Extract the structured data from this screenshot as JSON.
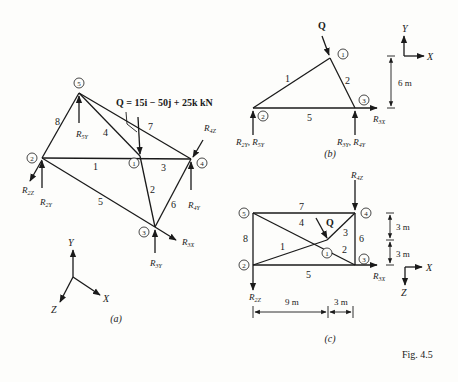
{
  "figure": {
    "caption": "Fig. 4.5",
    "views": [
      {
        "id": "a",
        "label": "(a)"
      },
      {
        "id": "b",
        "label": "(b)"
      },
      {
        "id": "c",
        "label": "(c)"
      }
    ],
    "load": {
      "name": "Q",
      "expression": "Q = 15i − 50j + 25k kN"
    },
    "nodes": [
      "1",
      "2",
      "3",
      "4",
      "5"
    ],
    "members": [
      "1",
      "2",
      "3",
      "4",
      "5",
      "6",
      "7",
      "8"
    ],
    "reactions_a": [
      "R5Y",
      "R2Z",
      "R2Y",
      "R4Z",
      "R4Y",
      "R3X",
      "R3Y"
    ],
    "axes_a": {
      "y": "Y",
      "x": "X",
      "z": "Z"
    },
    "view_b": {
      "reactions": {
        "left": "R2Y, R5Y",
        "right": "R3Y, R4Y",
        "horizontal": "R3X"
      },
      "dimension": "6 m",
      "axes": {
        "y": "Y",
        "x": "X"
      }
    },
    "view_c": {
      "reactions": {
        "top": "R4Z",
        "left": "R2Z",
        "horizontal": "R3X"
      },
      "dims_vertical": [
        "3 m",
        "3 m"
      ],
      "dims_horizontal": [
        "9 m",
        "3 m"
      ],
      "axes": {
        "x": "X",
        "z": "Z"
      }
    }
  }
}
